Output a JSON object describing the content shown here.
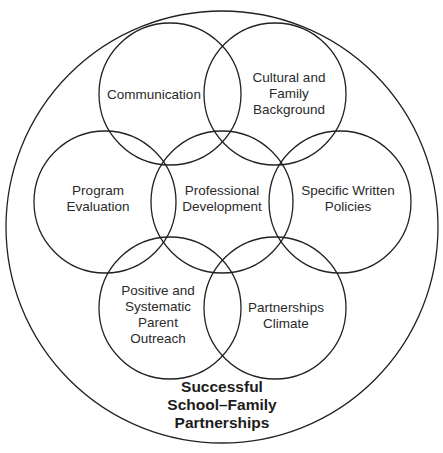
{
  "diagram": {
    "type": "nested-venn",
    "outer": {
      "label": "Successful\nSchool–Family\nPartnerships",
      "cx": 222,
      "cy": 227,
      "r": 216,
      "label_x": 222,
      "label_y": 405
    },
    "circles": [
      {
        "id": "communication",
        "label": "Communication",
        "cx": 170,
        "cy": 94,
        "r": 71,
        "label_x": 154,
        "label_y": 95
      },
      {
        "id": "cultural",
        "label": "Cultural and\nFamily\nBackground",
        "cx": 275,
        "cy": 94,
        "r": 71,
        "label_x": 289,
        "label_y": 94
      },
      {
        "id": "program-evaluation",
        "label": "Program\nEvaluation",
        "cx": 105,
        "cy": 202,
        "r": 71,
        "label_x": 98,
        "label_y": 199
      },
      {
        "id": "professional-development",
        "label": "Professional\nDevelopment",
        "cx": 222,
        "cy": 202,
        "r": 71,
        "label_x": 222,
        "label_y": 199
      },
      {
        "id": "specific-written-policies",
        "label": "Specific Written\nPolicies",
        "cx": 340,
        "cy": 202,
        "r": 71,
        "label_x": 348,
        "label_y": 199
      },
      {
        "id": "parent-outreach",
        "label": "Positive and\nSystematic\nParent\nOutreach",
        "cx": 170,
        "cy": 308,
        "r": 71,
        "label_x": 158,
        "label_y": 315
      },
      {
        "id": "partnerships-climate",
        "label": "Partnerships\nClimate",
        "cx": 275,
        "cy": 308,
        "r": 71,
        "label_x": 286,
        "label_y": 316
      }
    ],
    "colors": {
      "stroke": "#222222",
      "text": "#2a2a2a",
      "background": "#ffffff"
    }
  }
}
